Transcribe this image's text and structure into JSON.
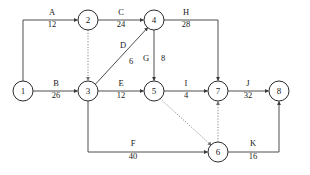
{
  "diagram": {
    "kind": "activity-on-arrow-network",
    "colors": {
      "background": "#ffffff",
      "node_stroke": "#2b2b2b",
      "node_fill": "#ffffff",
      "edge_solid": "#3a3a3a",
      "edge_dotted": "#7a7a7a",
      "text": "#1a1a1a"
    },
    "nodes": [
      {
        "id": "1",
        "label": "1",
        "x": 23,
        "y": 91,
        "r": 10
      },
      {
        "id": "2",
        "label": "2",
        "x": 88,
        "y": 20,
        "r": 10
      },
      {
        "id": "3",
        "label": "3",
        "x": 88,
        "y": 91,
        "r": 10
      },
      {
        "id": "4",
        "label": "4",
        "x": 154,
        "y": 20,
        "r": 10
      },
      {
        "id": "5",
        "label": "5",
        "x": 154,
        "y": 91,
        "r": 10
      },
      {
        "id": "6",
        "label": "6",
        "x": 218,
        "y": 152,
        "r": 10
      },
      {
        "id": "7",
        "label": "7",
        "x": 218,
        "y": 91,
        "r": 10
      },
      {
        "id": "8",
        "label": "8",
        "x": 279,
        "y": 91,
        "r": 10
      }
    ],
    "edges": [
      {
        "id": "A",
        "name": "A",
        "weight": "12",
        "from": "1",
        "to": "2",
        "style": "solid",
        "label_x": 52,
        "name_y": 15,
        "weight_y": 27
      },
      {
        "id": "B",
        "name": "B",
        "weight": "26",
        "from": "1",
        "to": "3",
        "style": "solid",
        "label_x": 56,
        "name_y": 86,
        "weight_y": 98
      },
      {
        "id": "C",
        "name": "C",
        "weight": "24",
        "from": "2",
        "to": "4",
        "style": "solid",
        "label_x": 121,
        "name_y": 15,
        "weight_y": 27
      },
      {
        "id": "D",
        "name": "D",
        "weight": "6",
        "from": "3",
        "to": "4",
        "style": "solid",
        "label_x": 123,
        "name_y": 48,
        "weight_y": 63
      },
      {
        "id": "E",
        "name": "E",
        "weight": "12",
        "from": "3",
        "to": "5",
        "style": "solid",
        "label_x": 121,
        "name_y": 86,
        "weight_y": 98
      },
      {
        "id": "F",
        "name": "F",
        "weight": "40",
        "from": "3",
        "to": "6",
        "style": "solid",
        "label_x": 133,
        "name_y": 145,
        "weight_y": 158
      },
      {
        "id": "G",
        "name": "G",
        "weight": "8",
        "from": "4",
        "to": "5",
        "style": "solid",
        "label_x": 146,
        "name_y": 62,
        "weight_y": 62
      },
      {
        "id": "H",
        "name": "H",
        "weight": "28",
        "from": "4",
        "to": "7",
        "style": "solid",
        "label_x": 186,
        "name_y": 15,
        "weight_y": 27
      },
      {
        "id": "I",
        "name": "I",
        "weight": "4",
        "from": "5",
        "to": "7",
        "style": "solid",
        "label_x": 186,
        "name_y": 86,
        "weight_y": 98
      },
      {
        "id": "J",
        "name": "J",
        "weight": "32",
        "from": "7",
        "to": "8",
        "style": "solid",
        "label_x": 248,
        "name_y": 86,
        "weight_y": 98
      },
      {
        "id": "K",
        "name": "K",
        "weight": "16",
        "from": "6",
        "to": "8",
        "style": "solid",
        "label_x": 252,
        "name_y": 145,
        "weight_y": 158
      },
      {
        "id": "dummy-2-3",
        "name": "",
        "weight": "",
        "from": "2",
        "to": "3",
        "style": "dotted"
      },
      {
        "id": "dummy-5-6",
        "name": "",
        "weight": "",
        "from": "5",
        "to": "6",
        "style": "dotted"
      },
      {
        "id": "dummy-6-7",
        "name": "",
        "weight": "",
        "from": "6",
        "to": "7",
        "style": "dotted"
      }
    ],
    "edge_labels": {
      "A": {
        "name": "A",
        "weight": "12"
      },
      "B": {
        "name": "B",
        "weight": "26"
      },
      "C": {
        "name": "C",
        "weight": "24"
      },
      "D": {
        "name": "D",
        "weight": "6"
      },
      "E": {
        "name": "E",
        "weight": "12"
      },
      "F": {
        "name": "F",
        "weight": "40"
      },
      "G": {
        "name": "G",
        "weight": "G-split"
      },
      "G_name": "G",
      "G_weight": "8",
      "H": {
        "name": "H",
        "weight": "28"
      },
      "I": {
        "name": "I",
        "weight": "4"
      },
      "J": {
        "name": "J",
        "weight": "32"
      },
      "K": {
        "name": "K",
        "weight": "16"
      }
    },
    "node_labels": {
      "n1": "1",
      "n2": "2",
      "n3": "3",
      "n4": "4",
      "n5": "5",
      "n6": "6",
      "n7": "7",
      "n8": "8"
    }
  }
}
